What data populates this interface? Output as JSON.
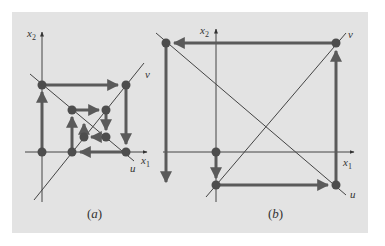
{
  "figure": {
    "background": "#e3e3e3",
    "line_color": "#4a4a4a",
    "path_color": "#5a5a5a",
    "point_color": "#4d4d4d"
  },
  "panel_a": {
    "caption_open": "(",
    "caption_letter": "a",
    "caption_close": ")",
    "x_axis_label": "x",
    "x_axis_sub": "1",
    "y_axis_label": "x",
    "y_axis_sub": "2",
    "u_label": "u",
    "v_label": "v",
    "behavior": "converging spiral",
    "points": [
      [
        42,
        85
      ],
      [
        126,
        85
      ],
      [
        126,
        152
      ],
      [
        72,
        152
      ],
      [
        72,
        110
      ],
      [
        106,
        110
      ],
      [
        106,
        137
      ],
      [
        84,
        137
      ],
      [
        42,
        152
      ]
    ]
  },
  "panel_b": {
    "caption_open": "(",
    "caption_letter": "b",
    "caption_close": ")",
    "x_axis_label": "x",
    "x_axis_sub": "1",
    "y_axis_label": "x",
    "y_axis_sub": "2",
    "u_label": "u",
    "v_label": "v",
    "behavior": "diverging spiral",
    "points": [
      [
        216,
        152
      ],
      [
        216,
        185
      ],
      [
        336,
        185
      ],
      [
        336,
        43
      ],
      [
        166,
        43
      ]
    ]
  }
}
